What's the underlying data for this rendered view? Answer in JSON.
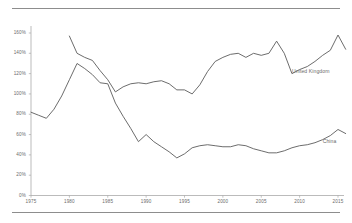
{
  "figure": {
    "background": "#ffffff",
    "line_color": "#5b5b5b",
    "axis_color": "#a9a9a9",
    "rule_color": "#8d8d8d",
    "label_color": "#6a6a6a"
  },
  "chart_data": {
    "type": "line",
    "title": "",
    "subtitle": "",
    "xlabel": "",
    "ylabel": "",
    "xlim": [
      1975,
      2016
    ],
    "ylim": [
      0,
      170
    ],
    "grid": false,
    "legend_position": "inline-right",
    "y_tick_labels": [
      "0%",
      "20%",
      "40%",
      "60%",
      "80%",
      "100%",
      "120%",
      "140%",
      "160%"
    ],
    "y_tick_values": [
      0,
      20,
      40,
      60,
      80,
      100,
      120,
      140,
      160
    ],
    "x_tick_labels": [
      "1975",
      "1980",
      "1985",
      "1990",
      "1995",
      "2000",
      "2005",
      "2010",
      "2015"
    ],
    "x_tick_values": [
      1975,
      1980,
      1985,
      1990,
      1995,
      2000,
      2005,
      2010,
      2015
    ],
    "series": [
      {
        "name": "United Kingdom",
        "label": "United Kingdom",
        "label_x": 2009,
        "label_y": 123,
        "x": [
          1980,
          1981,
          1982,
          1983,
          1984,
          1985,
          1986,
          1987,
          1988,
          1989,
          1990,
          1991,
          1992,
          1993,
          1994,
          1995,
          1996,
          1997,
          1998,
          1999,
          2000,
          2001,
          2002,
          2003,
          2004,
          2005,
          2006,
          2007,
          2008,
          2009,
          2010,
          2011,
          2012,
          2013,
          2014,
          2015,
          2016
        ],
        "values": [
          157,
          140,
          136,
          133,
          123,
          114,
          102,
          107,
          110,
          111,
          110,
          112,
          113,
          110,
          104,
          104,
          100,
          109,
          122,
          132,
          136,
          139,
          140,
          136,
          140,
          138,
          140,
          152,
          140,
          120,
          124,
          127,
          132,
          138,
          143,
          158,
          144
        ]
      },
      {
        "name": "China",
        "label": "China",
        "label_x": 2013,
        "label_y": 54,
        "x": [
          1975,
          1976,
          1977,
          1978,
          1979,
          1980,
          1981,
          1982,
          1983,
          1984,
          1985,
          1986,
          1987,
          1988,
          1989,
          1990,
          1991,
          1992,
          1993,
          1994,
          1995,
          1996,
          1997,
          1998,
          1999,
          2000,
          2001,
          2002,
          2003,
          2004,
          2005,
          2006,
          2007,
          2008,
          2009,
          2010,
          2011,
          2012,
          2013,
          2014,
          2015,
          2016
        ],
        "values": [
          82,
          79,
          76,
          85,
          98,
          114,
          130,
          125,
          119,
          111,
          110,
          91,
          78,
          66,
          53,
          60,
          53,
          48,
          43,
          37,
          41,
          47,
          49,
          50,
          49,
          48,
          48,
          50,
          49,
          46,
          44,
          42,
          42,
          44,
          47,
          49,
          50,
          52,
          55,
          59,
          65,
          61
        ]
      }
    ]
  }
}
